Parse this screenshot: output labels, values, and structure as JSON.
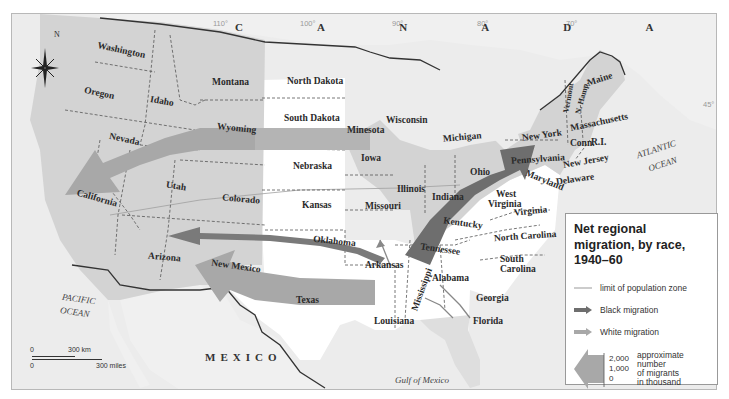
{
  "title": "Net regional migration, by race, 1940–60",
  "colors": {
    "background_land": "#f2f2f2",
    "water": "#eaeaea",
    "population_zone": "#d2d2d2",
    "black_migration": "#7a7a7a",
    "white_migration": "#a8a8a8",
    "south_unshaded": "#ffffff",
    "border": "#333333"
  },
  "countries": {
    "canada": "C A N A D A",
    "mexico": "MEXICO"
  },
  "oceans": {
    "pacific_line1": "PACIFIC",
    "pacific_line2": "OCEAN",
    "atlantic_line1": "ATLANTIC",
    "atlantic_line2": "OCEAN",
    "gulf": "Gulf of Mexico"
  },
  "degrees": {
    "d110": "110°",
    "d100": "100°",
    "d90": "90°",
    "d80": "80°",
    "d70": "70°",
    "d45": "45°",
    "d30": "30°"
  },
  "compass": {
    "north": "N"
  },
  "states": {
    "washington": "Washington",
    "oregon": "Oregon",
    "idaho": "Idaho",
    "montana": "Montana",
    "wyoming": "Wyoming",
    "nevada": "Nevada",
    "california": "California",
    "utah": "Utah",
    "colorado": "Colorado",
    "arizona": "Arizona",
    "new_mexico": "New Mexico",
    "texas": "Texas",
    "north_dakota": "North Dakota",
    "south_dakota": "South Dakota",
    "nebraska": "Nebraska",
    "kansas": "Kansas",
    "oklahoma": "Oklahoma",
    "minnesota": "Minesota",
    "iowa": "Iowa",
    "missouri": "Missouri",
    "arkansas": "Arkansas",
    "louisiana": "Louisiana",
    "wisconsin": "Wisconsin",
    "illinois": "Illinois",
    "michigan": "Michigan",
    "indiana": "Indiana",
    "ohio": "Ohio",
    "kentucky": "Kentucky",
    "tennessee": "Tennessee",
    "mississippi": "Mississippi",
    "alabama": "Alabama",
    "georgia": "Georgia",
    "florida": "Florida",
    "south_carolina_1": "South",
    "south_carolina_2": "Carolina",
    "north_carolina": "North Carolina",
    "virginia": "Virginia",
    "west_virginia_1": "West",
    "west_virginia_2": "Virginia",
    "maryland": "Maryland",
    "delaware": "Delaware",
    "new_jersey": "New Jersey",
    "pennsylvania": "Pennsylvania",
    "new_york": "New York",
    "connecticut": "Conn.",
    "rhode_island": "R.I.",
    "massachusetts": "Massachusetts",
    "vermont": "Vermont",
    "new_hampshire": "N. Hamp.",
    "maine": "Maine"
  },
  "legend": {
    "title": "Net regional migration, by race, 1940–60",
    "items": [
      {
        "symbol": "thin-line",
        "label": "limit of population zone"
      },
      {
        "symbol": "dark-arrow",
        "label": "Black migration"
      },
      {
        "symbol": "light-arrow",
        "label": "White migration"
      }
    ],
    "scale": {
      "ticks": [
        "2,000",
        "1,000",
        "0"
      ],
      "note_lines": [
        "approximate",
        "number",
        "of migrants",
        "in thousand"
      ]
    }
  },
  "scalebar": {
    "km_zero": "0",
    "km_label": "300 km",
    "mi_zero": "0",
    "mi_label": "300 miles"
  },
  "migration_flows": [
    {
      "race": "White",
      "from": "Great Plains (Nebraska/Wyoming)",
      "to": "California/Nevada",
      "approx_thousands": 1000
    },
    {
      "race": "White",
      "from": "Texas/Arkansas",
      "to": "Arizona/New Mexico",
      "approx_thousands": 1500
    },
    {
      "race": "Black",
      "from": "Oklahoma/Arkansas",
      "to": "Arizona",
      "approx_thousands": 500
    },
    {
      "race": "Black",
      "from": "Tennessee/Kentucky",
      "to": "Pennsylvania/Ohio",
      "approx_thousands": 1500
    },
    {
      "race": "White",
      "from": "Arkansas",
      "to": "Missouri",
      "approx_thousands": 50
    },
    {
      "race": "White",
      "from": "Alabama/Georgia",
      "to": "Florida",
      "approx_thousands": 50
    }
  ]
}
